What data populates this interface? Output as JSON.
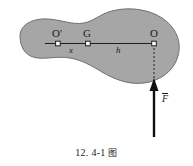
{
  "figure": {
    "title_caption": "12. 4-1",
    "caption_cjk": "图",
    "body": {
      "name": "rigid-body-blob",
      "fill_color": "#a6a6a6",
      "stroke_color": "#6e6e6e"
    },
    "points": [
      {
        "id": "O-prime",
        "label": "O'",
        "x": 58,
        "y": 43
      },
      {
        "id": "G",
        "label": "G",
        "x": 88,
        "y": 44
      },
      {
        "id": "O",
        "label": "O",
        "x": 154,
        "y": 43
      }
    ],
    "dimensions": [
      {
        "id": "x",
        "label": "x",
        "from": "O'",
        "to": "G"
      },
      {
        "id": "h",
        "label": "h",
        "from": "G",
        "to": "O"
      }
    ],
    "force": {
      "id": "F-vector",
      "label": "F",
      "notation": "overbar",
      "direction": "up",
      "color": "#111111"
    },
    "guides": {
      "axis_line": "solid horizontal line through O', G, O",
      "drop_line": "dashed vertical line from O to force arrow"
    }
  }
}
